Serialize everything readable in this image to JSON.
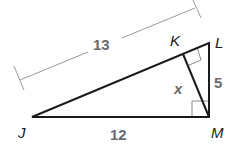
{
  "diagram": {
    "type": "right-triangle-with-altitude",
    "vertices": {
      "J": {
        "label": "J"
      },
      "K": {
        "label": "K"
      },
      "L": {
        "label": "L"
      },
      "M": {
        "label": "M"
      }
    },
    "measurements": {
      "JL": "13",
      "JM": "12",
      "LM": "5",
      "KM": "x"
    },
    "right_angles": [
      "M",
      "K"
    ],
    "colors": {
      "stroke": "#1a1a1a",
      "dimension_line": "#9a9a9a",
      "number_labels": "#6b6b6b",
      "right_angle_marks": "#8a8a8a"
    }
  }
}
